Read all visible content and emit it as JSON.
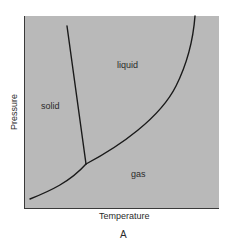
{
  "diagram": {
    "type": "phase-diagram",
    "figure_label": "A",
    "axes": {
      "x_label": "Temperature",
      "y_label": "Pressure"
    },
    "regions": {
      "solid": "solid",
      "liquid": "liquid",
      "gas": "gas"
    },
    "curves": [
      {
        "name": "fusion-line",
        "description": "solid-liquid boundary",
        "from": [
          67,
          26
        ],
        "to": [
          86,
          164
        ]
      },
      {
        "name": "vaporization-curve",
        "description": "liquid-gas boundary",
        "from": [
          86,
          164
        ],
        "to": [
          195,
          16
        ]
      },
      {
        "name": "sublimation-curve",
        "description": "solid-gas boundary",
        "from": [
          30,
          199
        ],
        "to": [
          86,
          164
        ]
      }
    ],
    "triple_point": [
      86,
      164
    ],
    "colors": {
      "background": "#b9b9b9",
      "line": "#1a1a1a",
      "text": "#2b2b2b"
    }
  }
}
